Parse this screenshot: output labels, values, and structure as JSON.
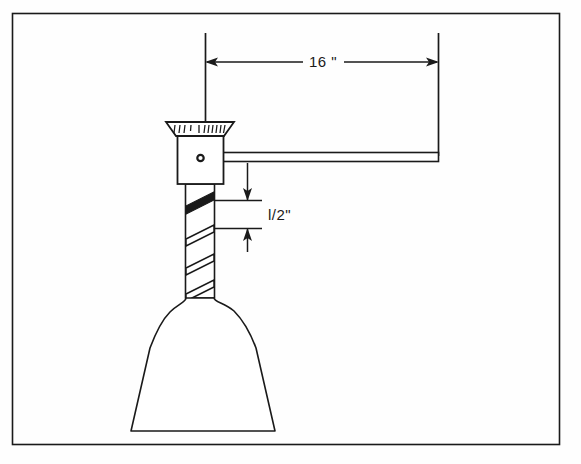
{
  "drawing": {
    "title": "Mechanical assembly elevation view",
    "background_color": "#fefefe",
    "line_color": "#1a1a1a",
    "fill_color": "#ffffff",
    "border": {
      "name": "drawing frame",
      "x": 12,
      "y": 13,
      "width": 548,
      "height": 432
    },
    "dimensions": [
      {
        "id": "horizontal_span",
        "label": "16 \"",
        "orientation": "horizontal",
        "value": 16,
        "unit": "inch",
        "text_x": 320,
        "text_y": 67,
        "line_y": 62,
        "from_x": 205,
        "to_x": 438,
        "ext_left_x": 205,
        "ext_left_y1": 33,
        "ext_left_y2": 122,
        "ext_right_x": 438,
        "ext_right_y1": 33,
        "ext_right_y2": 156
      },
      {
        "id": "band_thickness",
        "label": "l/2\"",
        "orientation": "vertical",
        "value": 0.5,
        "unit": "inch",
        "text_x": 268,
        "text_y": 220,
        "line_x": 247,
        "from_y": 200,
        "to_y": 228,
        "ext_top_y": 200,
        "ext_bot_y": 228,
        "ext_x1": 203,
        "ext_x2": 262
      }
    ],
    "parts": [
      {
        "id": "cap",
        "name": "flared brush cap",
        "shape": "trapezoid",
        "top_left_x": 166,
        "top_right_x": 234,
        "bottom_left_x": 176,
        "bottom_right_x": 224,
        "top_y": 122,
        "bottom_y": 136,
        "hatch_count": 13
      },
      {
        "id": "block",
        "name": "square body block",
        "shape": "rectangle",
        "x": 177,
        "y": 136,
        "width": 46,
        "height": 48
      },
      {
        "id": "hole",
        "name": "center hole",
        "shape": "circle",
        "cx": 200,
        "cy": 158,
        "r": 3.2
      },
      {
        "id": "arm",
        "name": "horizontal arm",
        "shape": "rectangle",
        "x": 223,
        "y": 152,
        "width": 216,
        "height": 9
      },
      {
        "id": "shaft",
        "name": "twisted spiral shaft",
        "shape": "rectangle",
        "x": 185,
        "y": 184,
        "width": 30,
        "height": 114,
        "band_count": 4,
        "first_band_filled": true
      },
      {
        "id": "bell",
        "name": "bell cone base",
        "shape": "bell",
        "top_y": 296,
        "bottom_y": 432,
        "neck_left_x": 186,
        "neck_right_x": 214,
        "base_left_x": 131,
        "base_right_x": 275
      }
    ]
  }
}
